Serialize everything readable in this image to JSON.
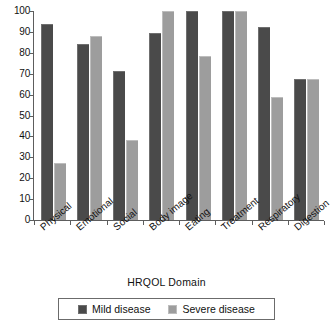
{
  "chart_data": {
    "type": "bar",
    "title": "",
    "xlabel": "HRQOL Domain",
    "ylabel": "",
    "ylim": [
      0,
      100
    ],
    "yticks": [
      0,
      10,
      20,
      30,
      40,
      50,
      60,
      70,
      80,
      90,
      100
    ],
    "grid": false,
    "legend_position": "bottom",
    "categories": [
      "Physical",
      "Emotional",
      "Social",
      "Body image",
      "Eating",
      "Treatment",
      "Respiratory",
      "Digestion"
    ],
    "series": [
      {
        "name": "Mild disease",
        "color": "#4a4a4a",
        "values": [
          94,
          84,
          71.5,
          89.5,
          100,
          100,
          92.5,
          67.5
        ]
      },
      {
        "name": "Severe disease",
        "color": "#9d9d9d",
        "values": [
          27.5,
          88,
          38.5,
          100,
          78.5,
          100,
          59,
          67.5
        ]
      }
    ]
  },
  "axis": {
    "y_tick_labels": [
      "0",
      "10",
      "20",
      "30",
      "40",
      "50",
      "60",
      "70",
      "80",
      "90",
      "100"
    ],
    "x_title": "HRQOL Domain"
  },
  "legend": {
    "items": [
      {
        "label": "Mild disease",
        "color": "#4a4a4a"
      },
      {
        "label": "Severe disease",
        "color": "#9d9d9d"
      }
    ]
  }
}
